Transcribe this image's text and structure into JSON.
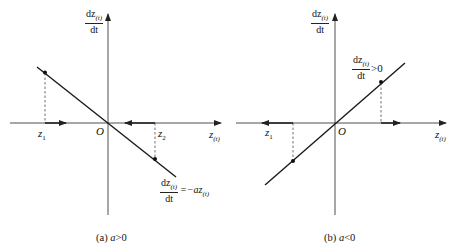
{
  "figure": {
    "panels": [
      {
        "id": "a",
        "caption": "(a) a>0",
        "caption_prefix": "(a) ",
        "caption_var": "a",
        "caption_rel": ">0",
        "y_axis_label_num": "dz",
        "y_axis_label_sub": "(t)",
        "y_axis_label_den": "dt",
        "x_axis_label": "z",
        "x_axis_label_sub": "(t)",
        "origin_label": "O",
        "point1_label": "z",
        "point1_sub": "1",
        "point2_label": "z",
        "point2_sub": "2",
        "equation_num": "dz",
        "equation_num_sub": "(t)",
        "equation_den": "dt",
        "equation_rhs": "=−az",
        "equation_rhs_sub": "(t)",
        "slope": "negative"
      },
      {
        "id": "b",
        "caption": "(b) a<0",
        "caption_prefix": "(b) ",
        "caption_var": "a",
        "caption_rel": "<0",
        "y_axis_label_num": "dz",
        "y_axis_label_sub": "(t)",
        "y_axis_label_den": "dt",
        "x_axis_label": "z",
        "x_axis_label_sub": "(t)",
        "origin_label": "O",
        "point1_label": "z",
        "point1_sub": "1",
        "annotation_num": "dz",
        "annotation_num_sub": "(t)",
        "annotation_den": "dt",
        "annotation_rhs": ">0",
        "slope": "positive"
      }
    ],
    "colors": {
      "line": "#1a1a1a",
      "axis": "#222222",
      "background": "#ffffff"
    }
  }
}
